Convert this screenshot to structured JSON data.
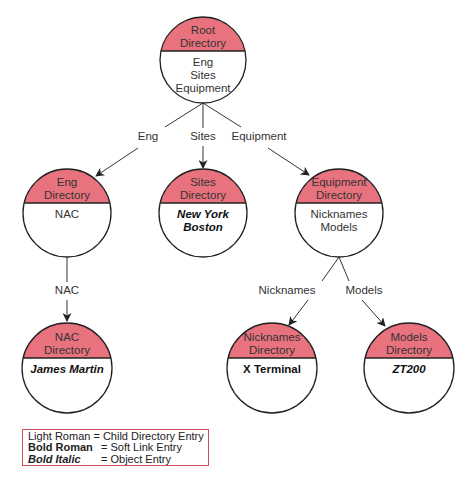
{
  "colors": {
    "directory_header": "#e8727e",
    "legend_border": "#d2505e",
    "stroke": "#222222"
  },
  "nodes": [
    {
      "id": "root",
      "title": [
        "Root",
        "Directory"
      ],
      "cx": 203,
      "cy": 60,
      "r": 43,
      "divider_y": 51,
      "entries": [
        {
          "text": "Eng",
          "style": "light"
        },
        {
          "text": "Sites",
          "style": "light"
        },
        {
          "text": "Equipment",
          "style": "light"
        }
      ]
    },
    {
      "id": "eng",
      "title": [
        "Eng",
        "Directory"
      ],
      "cx": 67,
      "cy": 213,
      "r": 44,
      "divider_y": 203,
      "entries": [
        {
          "text": "NAC",
          "style": "light"
        }
      ]
    },
    {
      "id": "sites",
      "title": [
        "Sites",
        "Directory"
      ],
      "cx": 203,
      "cy": 213,
      "r": 44,
      "divider_y": 203,
      "entries": [
        {
          "text": "New York",
          "style": "bold-italic"
        },
        {
          "text": "Boston",
          "style": "bold-italic"
        }
      ]
    },
    {
      "id": "equipment",
      "title": [
        "Equipment",
        "Directory"
      ],
      "cx": 339,
      "cy": 213,
      "r": 44,
      "divider_y": 203,
      "entries": [
        {
          "text": "Nicknames",
          "style": "light"
        },
        {
          "text": "Models",
          "style": "light"
        }
      ]
    },
    {
      "id": "nac",
      "title": [
        "NAC",
        "Directory"
      ],
      "cx": 67,
      "cy": 368,
      "r": 45,
      "divider_y": 358,
      "entries": [
        {
          "text": "James Martin",
          "style": "bold-italic"
        }
      ]
    },
    {
      "id": "nicknames",
      "title": [
        "Nicknames",
        "Directory"
      ],
      "cx": 272,
      "cy": 368,
      "r": 45,
      "divider_y": 358,
      "entries": [
        {
          "text": "X Terminal",
          "style": "bold"
        }
      ]
    },
    {
      "id": "models",
      "title": [
        "Models",
        "Directory"
      ],
      "cx": 409,
      "cy": 368,
      "r": 45,
      "divider_y": 358,
      "entries": [
        {
          "text": "ZT200",
          "style": "bold-italic"
        }
      ]
    }
  ],
  "edges": [
    {
      "label": "Eng",
      "label_x": 148,
      "label_y": 140,
      "from": [
        203,
        103
      ],
      "mid1": [
        165,
        127
      ],
      "mid2": [
        138,
        148
      ],
      "to": [
        96,
        176
      ]
    },
    {
      "label": "Sites",
      "label_x": 203,
      "label_y": 140,
      "from": [
        203,
        103
      ],
      "mid1": [
        203,
        128
      ],
      "mid2": [
        203,
        146
      ],
      "to": [
        203,
        168
      ]
    },
    {
      "label": "Equipment",
      "label_x": 259,
      "label_y": 140,
      "from": [
        203,
        103
      ],
      "mid1": [
        241,
        127
      ],
      "mid2": [
        268,
        148
      ],
      "to": [
        309,
        175
      ]
    },
    {
      "label": "NAC",
      "label_x": 67,
      "label_y": 294,
      "from": [
        67,
        257
      ],
      "mid1": [
        67,
        282
      ],
      "mid2": [
        67,
        300
      ],
      "to": [
        67,
        321
      ]
    },
    {
      "label": "Nicknames",
      "label_x": 287,
      "label_y": 294,
      "from": [
        339,
        257
      ],
      "mid1": [
        322,
        281
      ],
      "mid2": [
        308,
        300
      ],
      "to": [
        289,
        325
      ]
    },
    {
      "label": "Models",
      "label_x": 364,
      "label_y": 294,
      "from": [
        339,
        257
      ],
      "mid1": [
        349,
        281
      ],
      "mid2": [
        362,
        300
      ],
      "to": [
        385,
        326
      ]
    }
  ],
  "legend": {
    "rows": [
      {
        "key": "Light Roman",
        "style": "light",
        "sep": "=",
        "desc": "Child Directory Entry"
      },
      {
        "key": "Bold Roman",
        "style": "bold",
        "sep": "=",
        "desc": "Soft Link Entry"
      },
      {
        "key": "Bold Italic",
        "style": "bolditalic",
        "sep": "=",
        "desc": "Object Entry"
      }
    ]
  }
}
